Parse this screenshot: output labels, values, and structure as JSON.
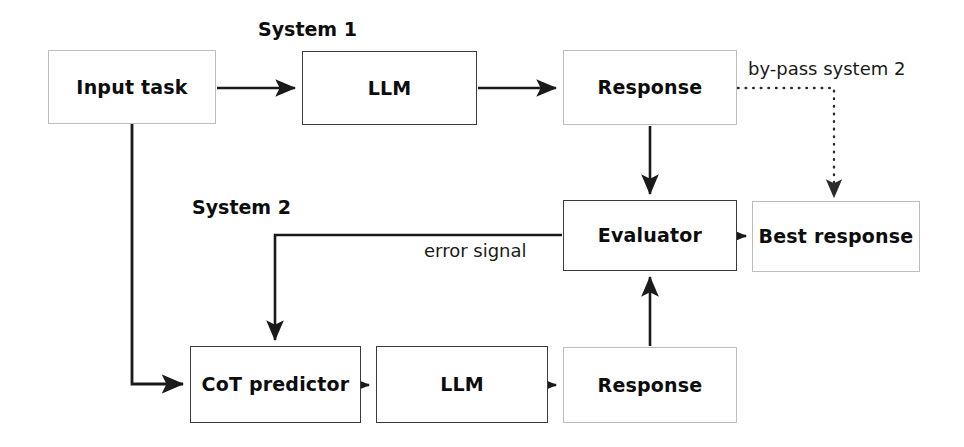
{
  "diagram": {
    "colors": {
      "background": "#ffffff",
      "stroke_solid": "#1a1a1a",
      "stroke_faint": "#bdbdbd",
      "text": "#0d0d0d",
      "dotted": "#2b2b2b"
    },
    "group_labels": [
      {
        "id": "system-1",
        "text": "System 1",
        "x": 258,
        "y": 18
      },
      {
        "id": "system-2",
        "text": "System 2",
        "x": 192,
        "y": 196
      }
    ],
    "nodes": [
      {
        "id": "input-task",
        "label": "Input task",
        "x": 48,
        "y": 50,
        "w": 168,
        "h": 74,
        "border": "faint"
      },
      {
        "id": "llm-system1",
        "label": "LLM",
        "x": 302,
        "y": 51,
        "w": 175,
        "h": 74,
        "border": "solid"
      },
      {
        "id": "response-system1",
        "label": "Response",
        "x": 563,
        "y": 50,
        "w": 174,
        "h": 75,
        "border": "faint"
      },
      {
        "id": "evaluator",
        "label": "Evaluator",
        "x": 563,
        "y": 200,
        "w": 174,
        "h": 71,
        "border": "solid"
      },
      {
        "id": "best-response",
        "label": "Best response",
        "x": 752,
        "y": 201,
        "w": 168,
        "h": 71,
        "border": "faint"
      },
      {
        "id": "cot-predictor",
        "label": "CoT predictor",
        "x": 190,
        "y": 346,
        "w": 171,
        "h": 77,
        "border": "solid"
      },
      {
        "id": "llm-system2",
        "label": "LLM",
        "x": 376,
        "y": 346,
        "w": 172,
        "h": 77,
        "border": "solid"
      },
      {
        "id": "response-system2",
        "label": "Response",
        "x": 563,
        "y": 347,
        "w": 174,
        "h": 76,
        "border": "faint"
      }
    ],
    "edge_labels": [
      {
        "id": "bypass-system-2",
        "text": "by-pass system 2",
        "x": 748,
        "y": 58
      },
      {
        "id": "error-signal",
        "text": "error signal",
        "x": 424,
        "y": 240
      }
    ],
    "edges": [
      {
        "id": "input-task-to-llm-system1",
        "style": "solid",
        "from": "input-task",
        "to": "llm-system1",
        "arrow": true
      },
      {
        "id": "llm-system1-to-response-system1",
        "style": "solid",
        "from": "llm-system1",
        "to": "response-system1",
        "arrow": true
      },
      {
        "id": "response-system1-to-evaluator",
        "style": "solid",
        "from": "response-system1",
        "to": "evaluator",
        "arrow": true
      },
      {
        "id": "response-system1-to-best-response",
        "style": "dotted",
        "from": "response-system1",
        "to": "best-response",
        "arrow": true
      },
      {
        "id": "evaluator-to-best-response",
        "style": "solid",
        "from": "evaluator",
        "to": "best-response",
        "arrow": true
      },
      {
        "id": "evaluator-to-cot-predictor",
        "style": "solid",
        "from": "evaluator",
        "to": "cot-predictor",
        "arrow": true
      },
      {
        "id": "input-task-to-cot-predictor",
        "style": "solid",
        "from": "input-task",
        "to": "cot-predictor",
        "arrow": true
      },
      {
        "id": "cot-predictor-to-llm-system2",
        "style": "solid",
        "from": "cot-predictor",
        "to": "llm-system2",
        "arrow": true
      },
      {
        "id": "llm-system2-to-response-system2",
        "style": "solid",
        "from": "llm-system2",
        "to": "response-system2",
        "arrow": true
      },
      {
        "id": "response-system2-to-evaluator",
        "style": "solid",
        "from": "response-system2",
        "to": "evaluator",
        "arrow": true
      }
    ]
  }
}
